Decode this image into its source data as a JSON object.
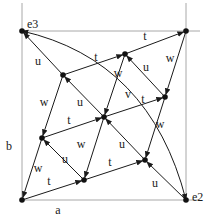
{
  "colors": {
    "ink": "#1a1a1a",
    "frame": "#a8a8a8",
    "background": "#ffffff"
  },
  "frame": {
    "left": 22,
    "right": 186,
    "top": 31,
    "bottom": 200
  },
  "frame_labels": [
    {
      "id": "a",
      "text": "a",
      "x": 58,
      "y": 214
    },
    {
      "id": "b",
      "text": "b",
      "x": 9,
      "y": 150
    }
  ],
  "nodes": [
    {
      "id": "e3",
      "x": 22,
      "y": 31,
      "label": "e3",
      "lx": 27,
      "ly": 24
    },
    {
      "id": "TR",
      "x": 186,
      "y": 31
    },
    {
      "id": "BL",
      "x": 22,
      "y": 200
    },
    {
      "id": "e2",
      "x": 186,
      "y": 200,
      "label": "e2",
      "lx": 192,
      "ly": 197
    },
    {
      "id": "A",
      "x": 63,
      "y": 75
    },
    {
      "id": "B",
      "x": 125,
      "y": 54
    },
    {
      "id": "C",
      "x": 165,
      "y": 97
    },
    {
      "id": "D",
      "x": 104,
      "y": 117
    },
    {
      "id": "E",
      "x": 42,
      "y": 138
    },
    {
      "id": "F",
      "x": 145,
      "y": 160
    },
    {
      "id": "G",
      "x": 84,
      "y": 180
    }
  ],
  "edges": [
    {
      "from": "BL",
      "to": "G",
      "label": "t",
      "lx": 49,
      "ly": 185
    },
    {
      "from": "G",
      "to": "F",
      "label": "t",
      "lx": 110,
      "ly": 166
    },
    {
      "from": "E",
      "to": "D",
      "label": "t",
      "lx": 69,
      "ly": 124
    },
    {
      "from": "D",
      "to": "C",
      "label": "t",
      "lx": 143,
      "ly": 103
    },
    {
      "from": "A",
      "to": "B",
      "label": "t",
      "lx": 96,
      "ly": 61
    },
    {
      "from": "B",
      "to": "TR",
      "label": "t",
      "lx": 145,
      "ly": 40
    },
    {
      "from": "TR",
      "to": "C",
      "label": "w",
      "lx": 170,
      "ly": 62
    },
    {
      "from": "C",
      "to": "F",
      "label": "w",
      "lx": 160,
      "ly": 128
    },
    {
      "from": "B",
      "to": "D",
      "label": "w",
      "lx": 118,
      "ly": 77
    },
    {
      "from": "D",
      "to": "G",
      "label": "w",
      "lx": 81,
      "ly": 148
    },
    {
      "from": "A",
      "to": "E",
      "label": "w",
      "lx": 44,
      "ly": 106
    },
    {
      "from": "E",
      "to": "BL",
      "label": "w",
      "lx": 38,
      "ly": 172
    },
    {
      "from": "e2",
      "to": "F",
      "label": "u",
      "lx": 155,
      "ly": 187
    },
    {
      "from": "F",
      "to": "D",
      "label": "u",
      "lx": 122,
      "ly": 148
    },
    {
      "from": "D",
      "to": "A",
      "label": "u",
      "lx": 80,
      "ly": 106
    },
    {
      "from": "A",
      "to": "e3",
      "label": "u",
      "lx": 38,
      "ly": 65
    },
    {
      "from": "C",
      "to": "B",
      "label": "u",
      "lx": 146,
      "ly": 71
    },
    {
      "from": "G",
      "to": "E",
      "label": "u",
      "lx": 65,
      "ly": 163
    }
  ],
  "arcs": [
    {
      "from": "e3",
      "to": "e2",
      "label": "v",
      "lx": 128,
      "ly": 98,
      "cx": 150,
      "cy": 60,
      "arrow_start": true,
      "arrow_end": true
    }
  ]
}
